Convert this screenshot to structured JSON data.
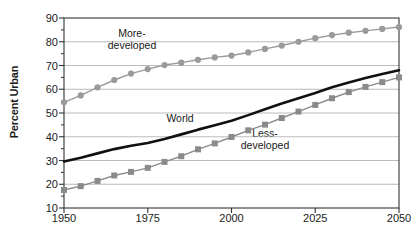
{
  "chart_data": {
    "type": "line",
    "title": "",
    "xlabel": "",
    "ylabel": "Percent Urban",
    "xlim": [
      1950,
      2050
    ],
    "ylim": [
      10,
      90
    ],
    "xticks": [
      1950,
      1975,
      2000,
      2025,
      2050
    ],
    "yticks": [
      10,
      20,
      30,
      40,
      50,
      60,
      70,
      80,
      90
    ],
    "grid": "horizontal",
    "legend_position": "inline-annotations",
    "x": [
      1950,
      1955,
      1960,
      1965,
      1970,
      1975,
      1980,
      1985,
      1990,
      1995,
      2000,
      2005,
      2010,
      2015,
      2020,
      2025,
      2030,
      2035,
      2040,
      2045,
      2050
    ],
    "series": [
      {
        "name": "More-developed",
        "marker": "circle",
        "color": "#9a9a9a",
        "values": [
          54.5,
          57.4,
          60.8,
          63.9,
          66.6,
          68.5,
          70.2,
          71.2,
          72.4,
          73.4,
          74.2,
          75.5,
          77.0,
          78.4,
          80.0,
          81.5,
          82.8,
          83.8,
          84.6,
          85.4,
          86.2
        ]
      },
      {
        "name": "World",
        "marker": "none",
        "color": "#111111",
        "values": [
          29.6,
          31.2,
          33.0,
          34.8,
          36.2,
          37.4,
          39.1,
          41.0,
          43.0,
          44.8,
          46.7,
          49.1,
          51.6,
          54.0,
          56.2,
          58.4,
          60.8,
          62.8,
          64.7,
          66.4,
          68.0
        ]
      },
      {
        "name": "Less-developed",
        "marker": "square",
        "color": "#8a8a8a",
        "values": [
          17.6,
          19.2,
          21.4,
          23.7,
          25.2,
          26.9,
          29.4,
          31.8,
          34.7,
          37.2,
          39.9,
          42.7,
          45.1,
          47.9,
          50.6,
          53.4,
          56.2,
          58.8,
          61.0,
          63.0,
          65.0
        ]
      }
    ],
    "annotations": [
      {
        "text_line1": "More-",
        "text_line2": "developed",
        "x": 1985,
        "y": 80
      },
      {
        "text_line1": "World",
        "text_line2": "",
        "x": 1993,
        "y": 43
      },
      {
        "text_line1": "Less-",
        "text_line2": "developed",
        "x": 2013,
        "y": 38
      }
    ],
    "axis_color": "#333333",
    "grid_color": "#aaaaaa"
  },
  "axes": {
    "ylabel": "Percent Urban",
    "ytick_labels": [
      "90",
      "80",
      "70",
      "60",
      "50",
      "40",
      "30",
      "20",
      "10"
    ],
    "xtick_labels": [
      "1950",
      "1975",
      "2000",
      "2025",
      "2050"
    ]
  },
  "labels": {
    "more_developed_l1": "More-",
    "more_developed_l2": "developed",
    "world": "World",
    "less_developed_l1": "Less-",
    "less_developed_l2": "developed"
  }
}
